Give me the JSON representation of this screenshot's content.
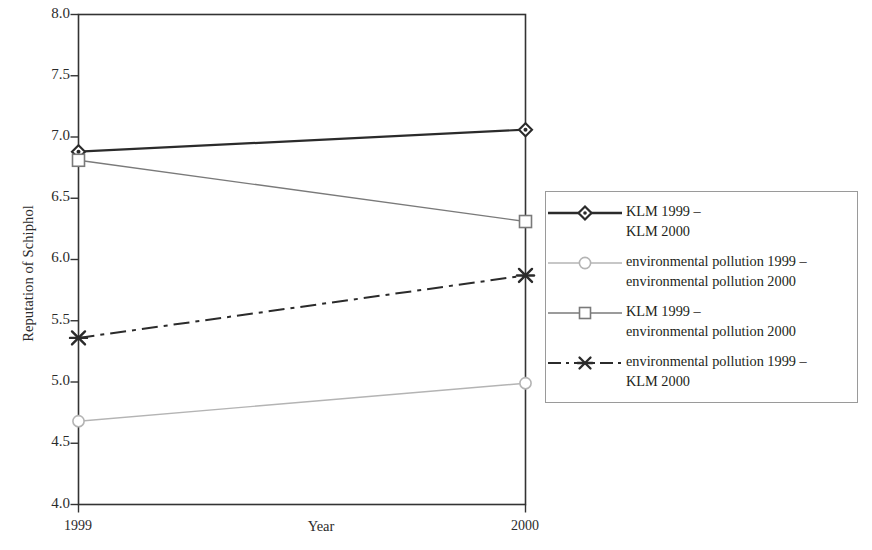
{
  "chart_data": {
    "type": "line",
    "title": "",
    "xlabel": "Year",
    "ylabel": "Reputation of Schiphol",
    "categories": [
      "1999",
      "2000"
    ],
    "x": [
      1999,
      2000
    ],
    "xtick_labels": [
      "1999",
      "2000"
    ],
    "ytick_labels": [
      "4.0",
      "4.5",
      "5.0",
      "5.5",
      "6.0",
      "6.5",
      "7.0",
      "7.5",
      "8.0"
    ],
    "ytick_values": [
      4.0,
      4.5,
      5.0,
      5.5,
      6.0,
      6.5,
      7.0,
      7.5,
      8.0
    ],
    "ylim": [
      4.0,
      8.0
    ],
    "grid": false,
    "legend_position": "right",
    "series": [
      {
        "name": "KLM 1999 –\nKLM 2000",
        "values": [
          6.88,
          7.06
        ],
        "marker": "diamond",
        "linestyle": "solid",
        "color": "#2b2b2b",
        "linewidth": 2.2
      },
      {
        "name": "environmental pollution 1999 –\nenvironmental pollution 2000",
        "values": [
          4.68,
          4.99
        ],
        "marker": "circle",
        "linestyle": "solid",
        "color": "#b4b4b4",
        "linewidth": 1.4
      },
      {
        "name": "KLM 1999 –\nenvironmental pollution 2000",
        "values": [
          6.81,
          6.31
        ],
        "marker": "square",
        "linestyle": "solid",
        "color": "#7a7a7a",
        "linewidth": 1.4
      },
      {
        "name": "environmental pollution 1999 –\nKLM 2000",
        "values": [
          5.36,
          5.87
        ],
        "marker": "x-star",
        "linestyle": "dash-dot",
        "color": "#2b2b2b",
        "linewidth": 2.0
      }
    ]
  },
  "axes": {
    "y_title": "Reputation of Schiphol",
    "x_title": "Year",
    "y_ticks": [
      "8.0",
      "7.5",
      "7.0",
      "6.5",
      "6.0",
      "5.5",
      "5.0",
      "4.5",
      "4.0"
    ],
    "x_ticks": [
      "1999",
      "2000"
    ]
  },
  "legend": {
    "entries": [
      {
        "label": "KLM 1999 –\nKLM 2000",
        "marker": "diamond-icon",
        "color": "#2b2b2b"
      },
      {
        "label": "environmental pollution 1999 –\nenvironmental pollution 2000",
        "marker": "circle-icon",
        "color": "#b4b4b4"
      },
      {
        "label": "KLM 1999 –\nenvironmental pollution 2000",
        "marker": "square-icon",
        "color": "#7a7a7a"
      },
      {
        "label": "environmental pollution 1999 –\nKLM 2000",
        "marker": "x-star-icon",
        "color": "#2b2b2b"
      }
    ]
  }
}
